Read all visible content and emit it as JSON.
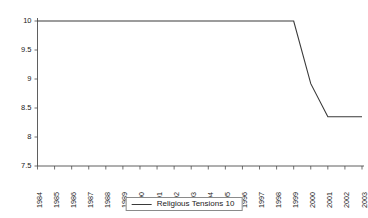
{
  "chart_data": {
    "type": "line",
    "title": "",
    "subtitle": "",
    "xlabel": "",
    "ylabel": "",
    "grid": false,
    "legend_position": "bottom-center",
    "xlim": [
      1984,
      2003
    ],
    "ylim": [
      7.5,
      10
    ],
    "ytick_labels": [
      "10",
      "9.5",
      "9",
      "8.5",
      "8",
      "7.5"
    ],
    "ytick_values": [
      10,
      9.5,
      9,
      8.5,
      8,
      7.5
    ],
    "categories": [
      "1984",
      "1985",
      "1986",
      "1987",
      "1988",
      "1989",
      "1990",
      "1991",
      "1992",
      "1993",
      "1994",
      "1995",
      "1996",
      "1997",
      "1998",
      "1999",
      "2000",
      "2001",
      "2002",
      "2003"
    ],
    "series": [
      {
        "name": "Religious Tensions 10",
        "color": "#3a3a3a",
        "values": [
          10,
          10,
          10,
          10,
          10,
          10,
          10,
          10,
          10,
          10,
          10,
          10,
          10,
          10,
          10,
          10,
          8.92,
          8.35,
          8.35,
          8.35
        ]
      }
    ]
  },
  "legend": {
    "entries": [
      {
        "label": "Religious Tensions 10"
      }
    ]
  },
  "colors": {
    "series": "#3a3a3a",
    "axis": "#4d4d4d",
    "text": "#1a1a1a",
    "background": "#ffffff",
    "legend_border": "#8a8a8a"
  }
}
